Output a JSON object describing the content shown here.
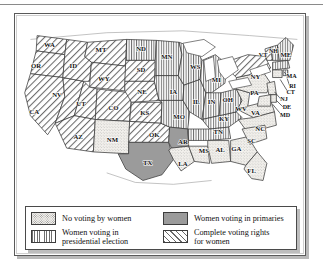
{
  "figure": {
    "map_type": "choropleth-pattern"
  },
  "legend": {
    "items": [
      {
        "id": "none",
        "label_line1": "No voting by women",
        "label_line2": "",
        "pattern": "stipple",
        "color": "#f2f0ec"
      },
      {
        "id": "primaries",
        "label_line1": "Women voting in primaries",
        "label_line2": "",
        "pattern": "solid",
        "color": "#9b9b9b"
      },
      {
        "id": "president",
        "label_line1": "Women voting in",
        "label_line2": "presidential election",
        "pattern": "vertical",
        "color": "#6f6f6f"
      },
      {
        "id": "full",
        "label_line1": "Complete voting rights",
        "label_line2": "for women",
        "pattern": "diagonal",
        "color": "#6a6a6a"
      }
    ]
  },
  "chart_data": {
    "type": "map",
    "categories": [
      "No voting by women",
      "Women voting in primaries",
      "Women voting in presidential election",
      "Complete voting rights for women"
    ],
    "legend_position": "bottom",
    "states": [
      {
        "code": "WA",
        "category": "full",
        "label_x": 60,
        "label_y": 46
      },
      {
        "code": "OR",
        "category": "full",
        "label_x": 46,
        "label_y": 68
      },
      {
        "code": "CA",
        "category": "full",
        "label_x": 44,
        "label_y": 117
      },
      {
        "code": "NV",
        "category": "full",
        "label_x": 68,
        "label_y": 99
      },
      {
        "code": "ID",
        "category": "full",
        "label_x": 85,
        "label_y": 68
      },
      {
        "code": "MT",
        "category": "full",
        "label_x": 114,
        "label_y": 52
      },
      {
        "code": "WY",
        "category": "full",
        "label_x": 117,
        "label_y": 82
      },
      {
        "code": "UT",
        "category": "full",
        "label_x": 93,
        "label_y": 108
      },
      {
        "code": "CO",
        "category": "full",
        "label_x": 127,
        "label_y": 112
      },
      {
        "code": "AZ",
        "category": "full",
        "label_x": 90,
        "label_y": 143
      },
      {
        "code": "NM",
        "category": "none",
        "label_x": 126,
        "label_y": 146
      },
      {
        "code": "ND",
        "category": "president",
        "label_x": 156,
        "label_y": 51
      },
      {
        "code": "SD",
        "category": "full",
        "label_x": 156,
        "label_y": 73
      },
      {
        "code": "NE",
        "category": "full",
        "label_x": 157,
        "label_y": 96
      },
      {
        "code": "KS",
        "category": "full",
        "label_x": 160,
        "label_y": 118
      },
      {
        "code": "OK",
        "category": "full",
        "label_x": 170,
        "label_y": 141
      },
      {
        "code": "TX",
        "category": "primaries",
        "label_x": 163,
        "label_y": 170
      },
      {
        "code": "MN",
        "category": "president",
        "label_x": 183,
        "label_y": 59
      },
      {
        "code": "IA",
        "category": "president",
        "label_x": 190,
        "label_y": 96
      },
      {
        "code": "MO",
        "category": "president",
        "label_x": 196,
        "label_y": 122
      },
      {
        "code": "AR",
        "category": "primaries",
        "label_x": 200,
        "label_y": 148
      },
      {
        "code": "LA",
        "category": "none",
        "label_x": 200,
        "label_y": 171
      },
      {
        "code": "WS",
        "category": "president",
        "label_x": 213,
        "label_y": 69
      },
      {
        "code": "IL",
        "category": "president",
        "label_x": 214,
        "label_y": 106
      },
      {
        "code": "MS",
        "category": "none",
        "label_x": 222,
        "label_y": 158
      },
      {
        "code": "MI",
        "category": "president",
        "label_x": 235,
        "label_y": 83
      },
      {
        "code": "IN",
        "category": "president",
        "label_x": 230,
        "label_y": 106
      },
      {
        "code": "KY",
        "category": "president",
        "label_x": 243,
        "label_y": 124
      },
      {
        "code": "TN",
        "category": "president",
        "label_x": 237,
        "label_y": 138
      },
      {
        "code": "AL",
        "category": "none",
        "label_x": 239,
        "label_y": 157
      },
      {
        "code": "OH",
        "category": "president",
        "label_x": 247,
        "label_y": 104
      },
      {
        "code": "GA",
        "category": "none",
        "label_x": 256,
        "label_y": 155
      },
      {
        "code": "FL",
        "category": "none",
        "label_x": 272,
        "label_y": 179
      },
      {
        "code": "WV",
        "category": "none",
        "label_x": 261,
        "label_y": 114
      },
      {
        "code": "VA",
        "category": "none",
        "label_x": 276,
        "label_y": 118
      },
      {
        "code": "NC",
        "category": "none",
        "label_x": 281,
        "label_y": 134
      },
      {
        "code": "SC",
        "category": "none",
        "label_x": 272,
        "label_y": 147
      },
      {
        "code": "PA",
        "category": "none",
        "label_x": 275,
        "label_y": 97
      },
      {
        "code": "NY",
        "category": "full",
        "label_x": 276,
        "label_y": 80
      },
      {
        "code": "VT",
        "category": "full",
        "label_x": 284,
        "label_y": 57
      },
      {
        "code": "NH",
        "category": "president",
        "label_x": 295,
        "label_y": 53
      },
      {
        "code": "ME",
        "category": "president",
        "label_x": 308,
        "label_y": 57
      },
      {
        "code": "MA",
        "category": "president",
        "label_x": 314,
        "label_y": 79
      },
      {
        "code": "RI",
        "category": "president",
        "label_x": 315,
        "label_y": 89
      },
      {
        "code": "CT",
        "category": "none",
        "label_x": 313,
        "label_y": 96
      },
      {
        "code": "NJ",
        "category": "none",
        "label_x": 306,
        "label_y": 103
      },
      {
        "code": "DE",
        "category": "none",
        "label_x": 309,
        "label_y": 112
      },
      {
        "code": "MD",
        "category": "none",
        "label_x": 307,
        "label_y": 120
      }
    ]
  }
}
